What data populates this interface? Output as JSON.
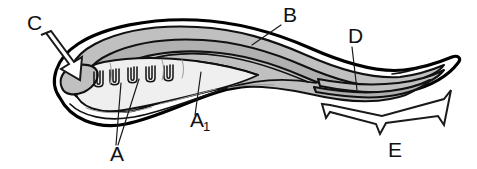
{
  "figure": {
    "background_color": "#ffffff",
    "width": 477,
    "height": 169,
    "ink_color": "#111111",
    "band_fill_color": "#c0c0c0",
    "band_fill_light": "#efefef"
  },
  "labels": [
    {
      "id": "A",
      "text": "A",
      "x": 110,
      "y": 161,
      "points_to": "pharyngeal-gill-bars",
      "leader_count": 2
    },
    {
      "id": "A1",
      "text": "A",
      "subscript": "1",
      "x": 196,
      "y": 127,
      "points_to": "pharynx-endostyle-region",
      "leader_count": 1
    },
    {
      "id": "B",
      "text": "B",
      "x": 283,
      "y": 22,
      "points_to": "dorsal-band-region",
      "leader_count": 1
    },
    {
      "id": "C",
      "text": "C",
      "x": 27,
      "y": 30,
      "points_to": "anterior-vesicle",
      "leader_count": 0,
      "marker": "block-arrow"
    },
    {
      "id": "D",
      "text": "D",
      "x": 348,
      "y": 43,
      "points_to": "posterior-band-convergence",
      "leader_count": 1
    },
    {
      "id": "E",
      "text": "E",
      "x": 388,
      "y": 157,
      "points_to": "tail-region",
      "leader_count": 0,
      "marker": "brace"
    }
  ],
  "structures": {
    "gill_bars": {
      "name": "U-shaped pharyngeal gill bars",
      "count": 5
    },
    "bands": {
      "name": "Nested longitudinal bands",
      "count": 4,
      "fill": "#c0c0c0"
    },
    "anterior_vesicle": {
      "name": "Anterior cerebral vesicle",
      "fill": "#c8c8c8"
    },
    "brace": {
      "name": "E-region span bracket",
      "span_start_x": 322,
      "span_end_x": 451
    }
  }
}
